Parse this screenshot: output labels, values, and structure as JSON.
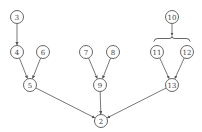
{
  "diagram": {
    "type": "tree",
    "nodes": [
      {
        "id": "3",
        "label": "3",
        "x": 17,
        "y": 17
      },
      {
        "id": "4",
        "label": "4",
        "x": 17,
        "y": 52
      },
      {
        "id": "6",
        "label": "6",
        "x": 43,
        "y": 52
      },
      {
        "id": "5",
        "label": "5",
        "x": 30,
        "y": 85
      },
      {
        "id": "7",
        "label": "7",
        "x": 86,
        "y": 52
      },
      {
        "id": "8",
        "label": "8",
        "x": 113,
        "y": 52
      },
      {
        "id": "9",
        "label": "9",
        "x": 100,
        "y": 85
      },
      {
        "id": "10",
        "label": "10",
        "x": 172,
        "y": 17
      },
      {
        "id": "11",
        "label": "11",
        "x": 157,
        "y": 52
      },
      {
        "id": "12",
        "label": "12",
        "x": 187,
        "y": 52
      },
      {
        "id": "13",
        "label": "13",
        "x": 172,
        "y": 85
      },
      {
        "id": "2",
        "label": "2",
        "x": 101,
        "y": 121
      }
    ],
    "edges": [
      {
        "from": "3",
        "to": "4"
      },
      {
        "from": "4",
        "to": "5"
      },
      {
        "from": "6",
        "to": "5"
      },
      {
        "from": "7",
        "to": "9"
      },
      {
        "from": "8",
        "to": "9"
      },
      {
        "from": "11",
        "to": "13"
      },
      {
        "from": "12",
        "to": "13"
      },
      {
        "from": "5",
        "to": "2"
      },
      {
        "from": "9",
        "to": "2"
      },
      {
        "from": "13",
        "to": "2"
      }
    ],
    "braces": [
      {
        "from": "10",
        "to_group": [
          "11",
          "12"
        ]
      }
    ],
    "node_radius": 6.5,
    "colors": {
      "stroke": "#555555",
      "text": "#444444",
      "background": "#ffffff"
    }
  }
}
